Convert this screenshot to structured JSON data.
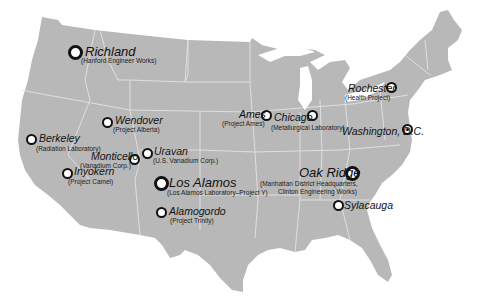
{
  "map": {
    "colors": {
      "land": "#b8b8b8",
      "borders": "#e8e8e8",
      "background": "#ffffff",
      "marker_stroke": "#111111"
    }
  },
  "sites": [
    {
      "name": "Richland",
      "sub": "(Hanford Engineer Works)",
      "size": "large"
    },
    {
      "name": "Wendover",
      "sub": "(Project Alberta)",
      "size": "small"
    },
    {
      "name": "Berkeley",
      "sub": "(Radiation Laboratory)",
      "size": "small"
    },
    {
      "name": "Inyokern",
      "sub": "(Project Camel)",
      "size": "small"
    },
    {
      "name": "Monticello",
      "sub": "(Vanadium Corp.)",
      "size": "small"
    },
    {
      "name": "Uravan",
      "sub": "(U.S. Vanadium Corp.)",
      "size": "small"
    },
    {
      "name": "Los Alamos",
      "sub": "(Los Alamos Laboratory–Project Y)",
      "size": "large"
    },
    {
      "name": "Alamogordo",
      "sub": "(Project Trinity)",
      "size": "small"
    },
    {
      "name": "Ames",
      "sub": "(Project Ames)",
      "size": "small"
    },
    {
      "name": "Chicago",
      "sub": "(Metallurgical Laboratory)",
      "size": "small"
    },
    {
      "name": "Rochester",
      "sub": "(Health Project)",
      "size": "small"
    },
    {
      "name": "Washington, D.C.",
      "sub": "",
      "size": "capital"
    },
    {
      "name": "Oak Ridge",
      "sub": "(Manhattan District Headquarters,",
      "sub2": "Clinton Engineering Works)",
      "size": "large"
    },
    {
      "name": "Sylacauga",
      "sub": "",
      "size": "small"
    }
  ]
}
